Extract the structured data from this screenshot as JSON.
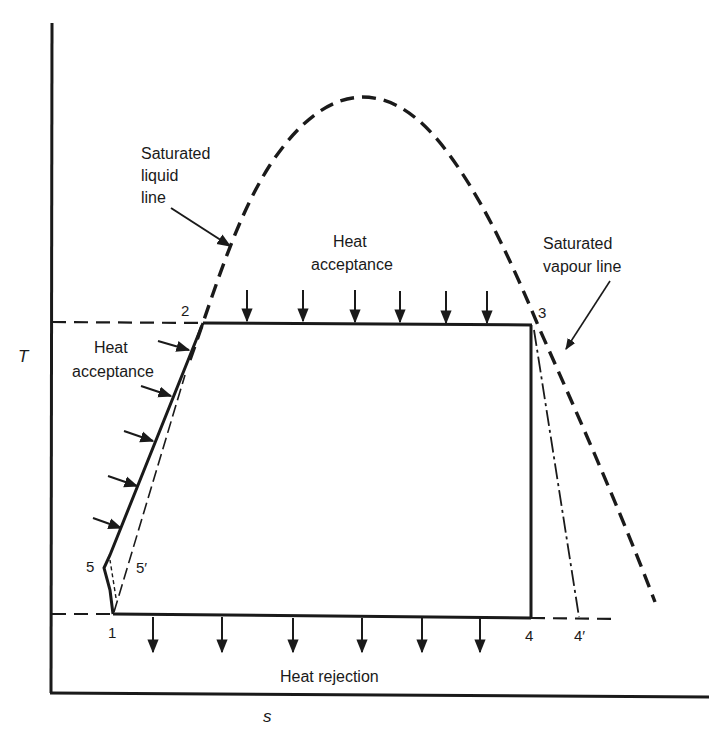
{
  "diagram": {
    "type": "T-s diagram (Rankine cycle with saturation dome)",
    "axes": {
      "y_label": "T",
      "x_label": "s"
    },
    "labels": {
      "saturated_liquid_line": [
        "Saturated",
        "liquid",
        "line"
      ],
      "saturated_vapour_line": [
        "Saturated",
        "vapour line"
      ],
      "heat_acceptance_top": [
        "Heat",
        "acceptance"
      ],
      "heat_acceptance_left": [
        "Heat",
        "acceptance"
      ],
      "heat_rejection": "Heat rejection"
    },
    "state_points": {
      "p1": "1",
      "p2": "2",
      "p3": "3",
      "p4": "4",
      "p4_prime": "4′",
      "p5": "5",
      "p5_prime": "5′"
    },
    "colors": {
      "ink": "#1a1a1a",
      "background": "#ffffff"
    }
  }
}
